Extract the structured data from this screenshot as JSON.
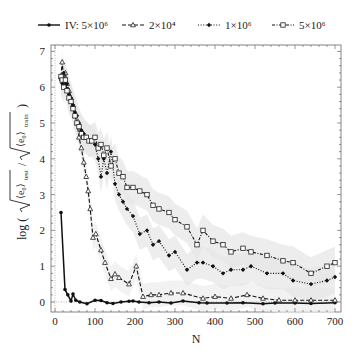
{
  "chart_data": {
    "type": "line",
    "title": "",
    "xlabel": "N",
    "ylabel": "log ( √⟨e₀⟩test / √⟨e₀⟩train )",
    "xlim": [
      -10,
      715
    ],
    "ylim": [
      -0.2,
      7.1
    ],
    "xticks": [
      0,
      100,
      200,
      300,
      400,
      500,
      600,
      700
    ],
    "yticks": [
      0,
      1,
      2,
      3,
      4,
      5,
      6,
      7
    ],
    "grid": false,
    "legend_position": "top",
    "series": [
      {
        "name": "IV: 5×10⁶",
        "line_style": "solid",
        "marker": "filled-circle",
        "x": [
          15,
          25,
          32,
          40,
          45,
          52,
          62,
          80,
          100,
          115,
          130,
          145,
          165,
          185,
          195,
          210,
          235,
          260,
          290,
          320,
          360,
          380,
          430,
          470,
          520,
          550,
          600,
          640,
          700
        ],
        "y": [
          2.5,
          0.35,
          0.2,
          0.03,
          0.22,
          0.05,
          0.0,
          -0.05,
          0.05,
          0.04,
          -0.02,
          -0.04,
          0.0,
          0.02,
          0.03,
          0.0,
          -0.02,
          0.0,
          -0.03,
          0.03,
          -0.02,
          -0.03,
          -0.03,
          -0.02,
          -0.05,
          -0.03,
          -0.03,
          -0.04,
          -0.02
        ]
      },
      {
        "name": "2×10⁴",
        "line_style": "dashed",
        "marker": "open-triangle",
        "x": [
          15,
          18,
          22,
          26,
          30,
          35,
          40,
          45,
          50,
          55,
          60,
          66,
          72,
          78,
          83,
          88,
          95,
          102,
          115,
          125,
          140,
          150,
          160,
          185,
          203,
          220,
          240,
          260,
          290,
          320,
          370,
          400,
          440,
          480,
          520,
          560,
          600,
          640,
          700
        ],
        "y": [
          6.3,
          6.7,
          6.2,
          6.4,
          6.1,
          5.9,
          5.7,
          5.5,
          5.2,
          5.0,
          4.6,
          4.3,
          3.9,
          3.5,
          3.1,
          2.6,
          1.8,
          1.9,
          1.45,
          1.1,
          0.65,
          0.78,
          0.68,
          0.5,
          1.0,
          0.15,
          0.2,
          0.2,
          0.25,
          0.25,
          0.1,
          0.15,
          0.1,
          0.2,
          0.1,
          0.05,
          0.05,
          0.05,
          0.05
        ]
      },
      {
        "name": "1×10⁶",
        "line_style": "dotted",
        "marker": "filled-diamond",
        "x": [
          15,
          18,
          22,
          26,
          30,
          35,
          40,
          45,
          50,
          55,
          60,
          66,
          72,
          78,
          85,
          92,
          100,
          108,
          115,
          122,
          130,
          140,
          150,
          160,
          170,
          180,
          195,
          212,
          230,
          245,
          260,
          285,
          300,
          330,
          355,
          370,
          395,
          420,
          440,
          470,
          490,
          530,
          570,
          595,
          640,
          680,
          700
        ],
        "y": [
          6.2,
          6.1,
          6.4,
          6.0,
          6.1,
          5.8,
          5.7,
          5.5,
          5.3,
          5.2,
          5.0,
          4.8,
          4.7,
          4.6,
          4.5,
          4.5,
          4.4,
          4.0,
          3.5,
          4.0,
          3.6,
          4.2,
          3.3,
          3.0,
          2.8,
          2.6,
          2.4,
          1.9,
          2.0,
          1.6,
          1.7,
          1.3,
          1.4,
          0.9,
          1.1,
          1.1,
          1.0,
          0.8,
          0.9,
          0.9,
          1.0,
          0.8,
          0.8,
          0.6,
          0.5,
          0.6,
          0.7
        ]
      },
      {
        "name": "5×10⁶",
        "line_style": "dash-dot",
        "marker": "open-square",
        "x": [
          15,
          18,
          22,
          26,
          30,
          35,
          40,
          45,
          50,
          55,
          60,
          66,
          72,
          78,
          85,
          92,
          100,
          108,
          115,
          122,
          130,
          140,
          150,
          160,
          170,
          180,
          195,
          212,
          230,
          245,
          260,
          285,
          300,
          330,
          355,
          370,
          395,
          420,
          440,
          470,
          490,
          530,
          570,
          595,
          640,
          680,
          700
        ],
        "y": [
          6.3,
          6.2,
          6.0,
          6.2,
          5.9,
          5.7,
          5.6,
          5.4,
          5.2,
          5.0,
          4.9,
          4.7,
          4.6,
          4.6,
          4.5,
          4.5,
          4.6,
          4.3,
          4.4,
          4.1,
          4.3,
          3.8,
          4.0,
          3.6,
          3.5,
          3.2,
          3.2,
          3.1,
          3.0,
          2.7,
          2.6,
          2.5,
          2.3,
          2.1,
          1.6,
          2.0,
          1.7,
          1.6,
          1.4,
          1.5,
          1.4,
          1.3,
          1.15,
          1.1,
          0.8,
          1.0,
          1.1
        ]
      }
    ]
  },
  "legend": {
    "items": [
      {
        "label": "IV: 5×10⁶"
      },
      {
        "label": "2×10⁴"
      },
      {
        "label": "1×10⁶"
      },
      {
        "label": "5×10⁶"
      }
    ]
  },
  "axes": {
    "xlabel": "N",
    "ylabel_prefix": "log (",
    "ylabel_suffix": ")",
    "x_tick_labels": [
      "0",
      "100",
      "200",
      "300",
      "400",
      "500",
      "600",
      "700"
    ],
    "y_tick_labels": [
      "0",
      "1",
      "2",
      "3",
      "4",
      "5",
      "6",
      "7"
    ]
  }
}
